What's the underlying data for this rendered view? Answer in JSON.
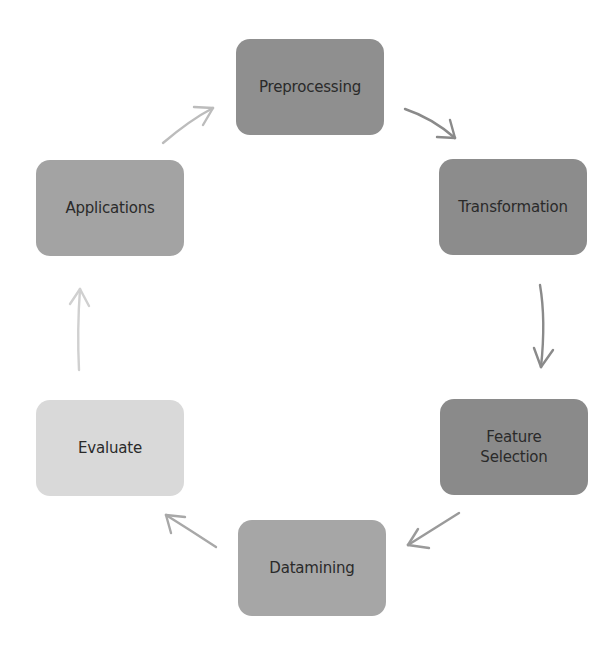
{
  "diagram": {
    "type": "cycle",
    "nodes": [
      {
        "id": "preprocessing",
        "label": "Preprocessing",
        "x": 236,
        "y": 39,
        "color": "#8f8f8f"
      },
      {
        "id": "transformation",
        "label": "Transformation",
        "x": 439,
        "y": 159,
        "color": "#8c8c8c"
      },
      {
        "id": "feature-selection",
        "label": "Feature\nSelection",
        "x": 440,
        "y": 399,
        "color": "#8a8a8a"
      },
      {
        "id": "datamining",
        "label": "Datamining",
        "x": 238,
        "y": 520,
        "color": "#a6a6a6"
      },
      {
        "id": "evaluate",
        "label": "Evaluate",
        "x": 36,
        "y": 400,
        "color": "#d9d9d9"
      },
      {
        "id": "applications",
        "label": "Applications",
        "x": 36,
        "y": 160,
        "color": "#a3a3a3"
      }
    ],
    "edges": [
      {
        "from": "preprocessing",
        "to": "transformation",
        "color": "#8a8a8a"
      },
      {
        "from": "transformation",
        "to": "feature-selection",
        "color": "#8a8a8a"
      },
      {
        "from": "feature-selection",
        "to": "datamining",
        "color": "#9a9a9a"
      },
      {
        "from": "datamining",
        "to": "evaluate",
        "color": "#a8a8a8"
      },
      {
        "from": "evaluate",
        "to": "applications",
        "color": "#d0d0d0"
      },
      {
        "from": "applications",
        "to": "preprocessing",
        "color": "#bcbcbc"
      }
    ]
  }
}
